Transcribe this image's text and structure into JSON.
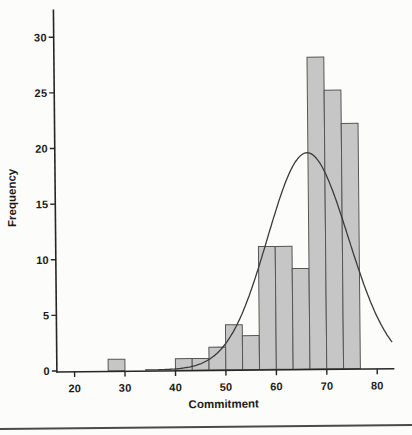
{
  "page": {
    "background_color": "#fcfcfa",
    "divider_color": "#4a4a4a"
  },
  "chart_data": {
    "type": "bar",
    "variant": "histogram_with_normal_curve",
    "title": "",
    "xlabel": "Commitment",
    "ylabel": "Frequency",
    "x_ticks": [
      20,
      30,
      40,
      50,
      60,
      70,
      80
    ],
    "y_ticks": [
      0,
      5,
      10,
      15,
      20,
      25,
      30
    ],
    "xlim": [
      16.5,
      83.4
    ],
    "ylim": [
      0,
      32.5
    ],
    "grid": false,
    "legend": false,
    "bin_width": 3.333,
    "bins": [
      {
        "start": 26.67,
        "end": 30.0,
        "count": 1
      },
      {
        "start": 40.0,
        "end": 43.33,
        "count": 1
      },
      {
        "start": 43.33,
        "end": 46.67,
        "count": 1
      },
      {
        "start": 46.67,
        "end": 50.0,
        "count": 2
      },
      {
        "start": 50.0,
        "end": 53.33,
        "count": 4
      },
      {
        "start": 53.33,
        "end": 56.67,
        "count": 3
      },
      {
        "start": 56.67,
        "end": 60.0,
        "count": 11
      },
      {
        "start": 60.0,
        "end": 63.33,
        "count": 11
      },
      {
        "start": 63.33,
        "end": 66.67,
        "count": 9
      },
      {
        "start": 66.67,
        "end": 70.0,
        "count": 28
      },
      {
        "start": 70.0,
        "end": 73.33,
        "count": 25
      },
      {
        "start": 73.33,
        "end": 76.67,
        "count": 22
      }
    ],
    "normal_curve": {
      "mean": 66.5,
      "sd": 8.0,
      "peak_height": 19.4,
      "x_start": 34.0,
      "x_end": 83.2
    },
    "colors": {
      "bar_fill": "#c6c6c6",
      "bar_border": "#565656",
      "curve": "#3a3a3a",
      "axis": "#262626",
      "text": "#1b1b1b"
    }
  }
}
